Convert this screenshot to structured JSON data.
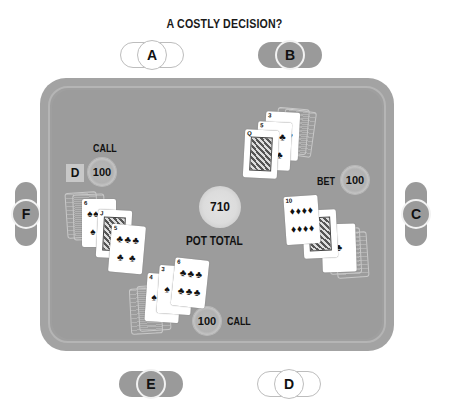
{
  "title": "A COSTLY DECISION?",
  "seats": [
    {
      "id": "A",
      "style": "light",
      "position": "top-left"
    },
    {
      "id": "B",
      "style": "dark",
      "position": "top-right"
    },
    {
      "id": "C",
      "style": "dark",
      "position": "right"
    },
    {
      "id": "D",
      "style": "light",
      "position": "bottom-right"
    },
    {
      "id": "E",
      "style": "dark",
      "position": "bottom-left"
    },
    {
      "id": "F",
      "style": "dark",
      "position": "left"
    }
  ],
  "pot": {
    "value": "710",
    "label": "POT TOTAL"
  },
  "dealer_button": "D",
  "actions": {
    "F": {
      "label": "CALL",
      "amount": "100"
    },
    "C": {
      "label": "BET",
      "amount": "100"
    },
    "E": {
      "label": "CALL",
      "amount": "100"
    }
  },
  "hands": {
    "F": [
      {
        "rank": "6",
        "suit": "♠"
      },
      {
        "rank": "J",
        "suit": "♣"
      },
      {
        "rank": "5",
        "suit": "♣"
      }
    ],
    "B": [
      {
        "rank": "Q",
        "suit": "♣"
      },
      {
        "rank": "5",
        "suit": "♣"
      },
      {
        "rank": "3",
        "suit": "♥"
      }
    ],
    "C": [
      {
        "rank": "10",
        "suit": "♦"
      },
      {
        "rank": "J",
        "suit": "♣"
      },
      {
        "rank": "A",
        "suit": "♣"
      }
    ],
    "E": [
      {
        "rank": "4",
        "suit": "♠"
      },
      {
        "rank": "3",
        "suit": "♠"
      },
      {
        "rank": "6",
        "suit": "♣"
      }
    ]
  },
  "colors": {
    "table": "#9c9c9c",
    "rim": "#a3a3a3",
    "dark_seat": "#9a9a9a"
  }
}
